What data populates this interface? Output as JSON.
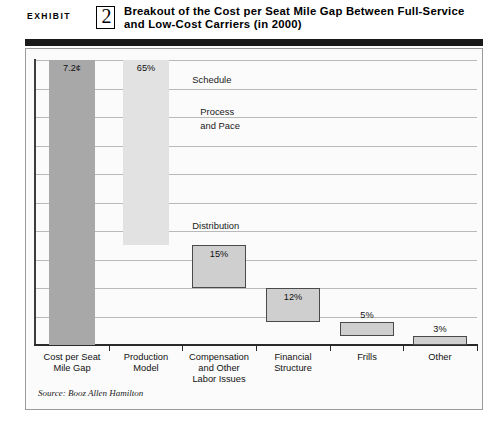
{
  "header": {
    "exhibit_word": "EXHIBIT",
    "exhibit_number": "2",
    "title": "Breakout of the Cost per Seat Mile Gap Between Full-Service and Low-Cost Carriers (in 2000)"
  },
  "source_note": "Source: Booz Allen Hamilton",
  "colors": {
    "bar_total": "#a8a8a8",
    "bar_production": "#e2e2e2",
    "bar_component": "#cfcfcf",
    "gridline": "#b9b9b9",
    "axis": "#2a2a2a",
    "header_bar": "#1a1a1a",
    "panel_bg": "#fbfbfb"
  },
  "chart_data": {
    "type": "bar",
    "title": "Breakout of the Cost per Seat Mile Gap Between Full-Service and Low-Cost Carriers (in 2000)",
    "xlabel": "",
    "ylabel": "",
    "grid": true,
    "gridlines": 10,
    "legend": "none",
    "ylim": [
      0,
      100
    ],
    "categories": [
      "Cost per Seat Mile Gap",
      "Production Model",
      "Compensation and Other Labor Issues",
      "Financial Structure",
      "Frills",
      "Other"
    ],
    "values": [
      100,
      65,
      15,
      12,
      5,
      3
    ],
    "data_labels": [
      "7.2¢",
      "65%",
      "15%",
      "12%",
      "5%",
      "3%"
    ],
    "bars": [
      {
        "label": "7.2¢",
        "category": "Cost per Seat Mile Gap",
        "value": 100,
        "top_pct": 0,
        "bottom_pct": 100,
        "fill": "#a8a8a8",
        "bordered": false
      },
      {
        "label": "65%",
        "category": "Production Model",
        "value": 65,
        "top_pct": 0,
        "bottom_pct": 65,
        "fill": "#e2e2e2",
        "bordered": false
      },
      {
        "label": "15%",
        "category": "Compensation and Other Labor Issues",
        "value": 15,
        "top_pct": 65,
        "bottom_pct": 80,
        "fill": "#cfcfcf",
        "bordered": true
      },
      {
        "label": "12%",
        "category": "Financial Structure",
        "value": 12,
        "top_pct": 80,
        "bottom_pct": 92,
        "fill": "#cfcfcf",
        "bordered": true
      },
      {
        "label": "5%",
        "category": "Frills",
        "value": 5,
        "top_pct": 92,
        "bottom_pct": 97,
        "fill": "#cfcfcf",
        "bordered": true
      },
      {
        "label": "3%",
        "category": "Other",
        "value": 3,
        "top_pct": 97,
        "bottom_pct": 100,
        "fill": "#cfcfcf",
        "bordered": true
      }
    ],
    "annotations": [
      {
        "text": "Schedule",
        "at_pct": 5
      },
      {
        "text": "Process",
        "at_pct": 16
      },
      {
        "text": "and Pace",
        "at_pct": 21
      },
      {
        "text": "Distribution",
        "at_pct": 56
      }
    ]
  },
  "category_labels": [
    {
      "line1": "Cost per Seat",
      "line2": "Mile Gap",
      "line3": ""
    },
    {
      "line1": "Production",
      "line2": "Model",
      "line3": ""
    },
    {
      "line1": "Compensation",
      "line2": "and Other",
      "line3": "Labor Issues"
    },
    {
      "line1": "Financial",
      "line2": "Structure",
      "line3": ""
    },
    {
      "line1": "Frills",
      "line2": "",
      "line3": ""
    },
    {
      "line1": "Other",
      "line2": "",
      "line3": ""
    }
  ]
}
